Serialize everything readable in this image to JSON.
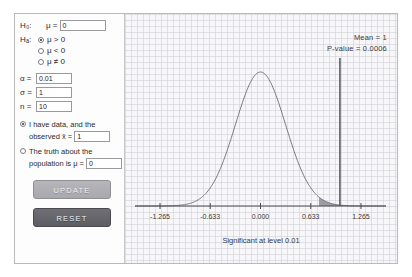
{
  "panel": {
    "null_hypothesis": {
      "label": "H₀:",
      "operator": "μ =",
      "value": "0"
    },
    "alt_hypothesis": {
      "label": "Hₐ:",
      "options": [
        {
          "text": "μ > 0",
          "selected": true
        },
        {
          "text": "μ < 0",
          "selected": false
        },
        {
          "text": "μ ≠ 0",
          "selected": false
        }
      ]
    },
    "parameters": [
      {
        "symbol": "α =",
        "value": "0.01"
      },
      {
        "symbol": "σ =",
        "value": "1"
      },
      {
        "symbol": "n =",
        "value": "10"
      }
    ],
    "data_source": {
      "have_data": {
        "line1": "I have data, and the",
        "line2": "observed x̄ =",
        "value": "1",
        "selected": true
      },
      "truth": {
        "line1": "The truth about the",
        "line2": "population is μ =",
        "value": "0",
        "selected": false
      }
    },
    "buttons": {
      "update": "UPDATE",
      "reset": "RESET"
    }
  },
  "chart_data": {
    "type": "line",
    "title": "",
    "xlabel": "",
    "ylabel": "",
    "caption": "Significant at level 0.01",
    "annotations": {
      "mean": "Mean = 1",
      "pvalue": "P-value = 0.0006"
    },
    "xlim": [
      -1.58,
      1.58
    ],
    "ylim": [
      0,
      1
    ],
    "grid": true,
    "tick_labels": [
      "-1.265",
      "-0.633",
      "0.000",
      "0.633",
      "1.265"
    ],
    "tick_values": [
      -1.265,
      -0.633,
      0.0,
      0.633,
      1.265
    ],
    "curve": {
      "name": "sampling distribution of x̄",
      "distribution": "normal",
      "mean": 0.0,
      "sd": 0.3162
    },
    "mean_marker": {
      "label": "Mean",
      "value": 1.0
    },
    "critical_value": 0.736,
    "shaded_region": {
      "from": 0.736,
      "to": 1.58,
      "label": "rejection region"
    },
    "alpha": 0.01,
    "pvalue": 0.0006
  }
}
